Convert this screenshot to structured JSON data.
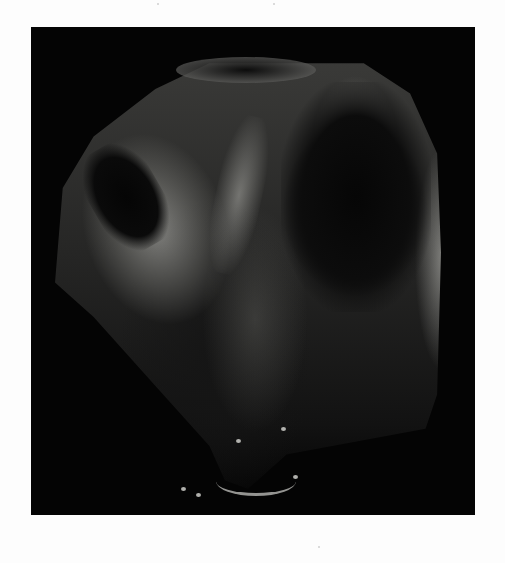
{
  "page": {
    "background": "#fdfdfd"
  },
  "photo": {
    "frame_color": "#040404",
    "subject": "skull-shaped weathered stone",
    "subject_tones": [
      "#3a3a38",
      "#262625",
      "#121212"
    ],
    "highlight_color": "#c8c8c3"
  }
}
